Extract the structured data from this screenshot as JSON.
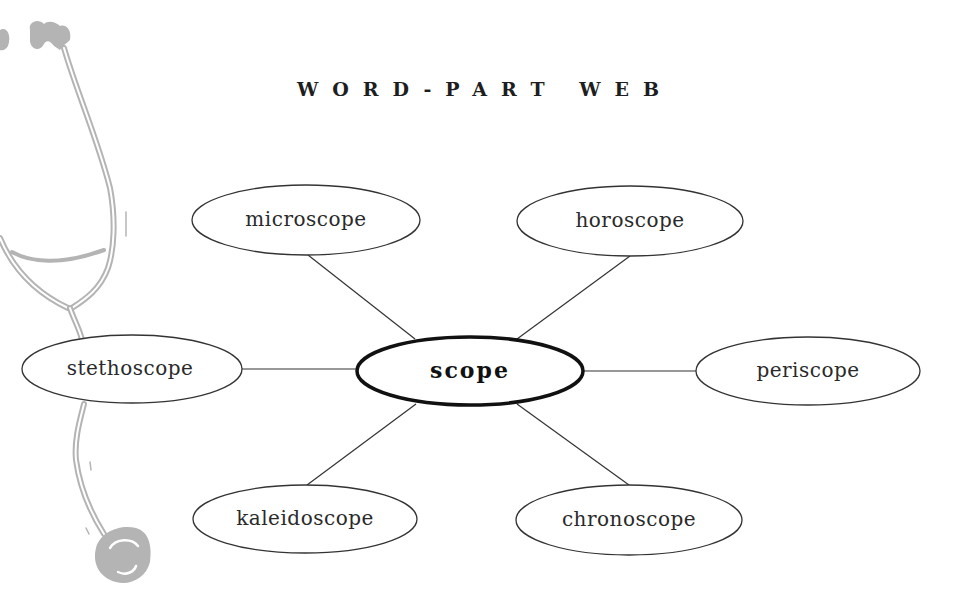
{
  "top_partial_text": "",
  "title": "WORD-PART WEB",
  "center": {
    "label": "scope",
    "cx": 470,
    "cy": 371,
    "rx": 113,
    "ry": 34
  },
  "nodes": [
    {
      "id": "microscope",
      "label": "microscope",
      "cx": 306,
      "cy": 220,
      "rx": 114,
      "ry": 35,
      "line": [
        308,
        255,
        415,
        339
      ]
    },
    {
      "id": "horoscope",
      "label": "horoscope",
      "cx": 630,
      "cy": 221,
      "rx": 113,
      "ry": 35,
      "line": [
        630,
        256,
        517,
        339
      ]
    },
    {
      "id": "stethoscope",
      "label": "stethoscope",
      "cx": 132,
      "cy": 369,
      "rx": 110,
      "ry": 34,
      "line": [
        242,
        369,
        357,
        369
      ]
    },
    {
      "id": "periscope",
      "label": "periscope",
      "cx": 808,
      "cy": 371,
      "rx": 112,
      "ry": 34,
      "line": [
        583,
        371,
        696,
        371
      ]
    },
    {
      "id": "kaleidoscope",
      "label": "kaleidoscope",
      "cx": 305,
      "cy": 519,
      "rx": 112,
      "ry": 34,
      "line": [
        416,
        404,
        307,
        485
      ]
    },
    {
      "id": "chronoscope",
      "label": "chronoscope",
      "cx": 629,
      "cy": 520,
      "rx": 113,
      "ry": 35,
      "line": [
        517,
        404,
        629,
        485
      ]
    }
  ],
  "decoration": {
    "icon": "stethoscope-illustration",
    "color": "#b4b4b4"
  },
  "colors": {
    "stroke": "#333333",
    "center_stroke": "#111111",
    "text": "#2a2a2a"
  }
}
